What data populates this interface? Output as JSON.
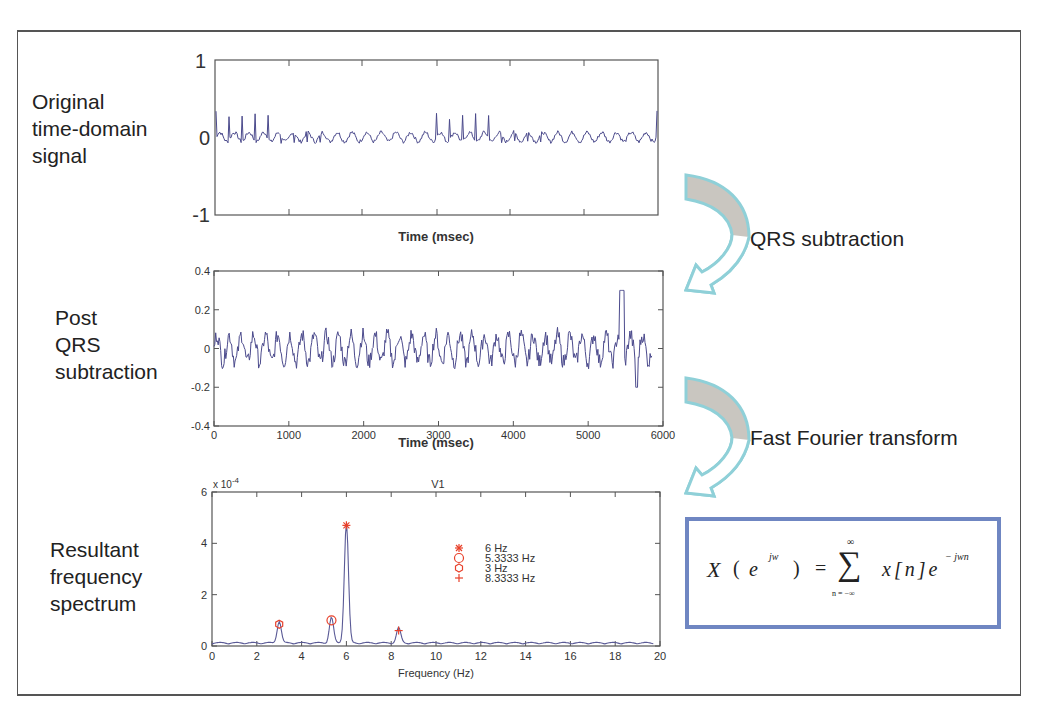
{
  "stages": {
    "original": {
      "label_lines": [
        "Original",
        "time-domain",
        "signal"
      ]
    },
    "post_qrs": {
      "label_lines": [
        "Post",
        "QRS",
        "subtraction"
      ]
    },
    "spectrum": {
      "label_lines": [
        "Resultant",
        "frequency",
        "spectrum"
      ]
    }
  },
  "arrows": {
    "qrs": {
      "label": "QRS subtraction",
      "icon": "curved-arrow-icon"
    },
    "fft": {
      "label": "Fast Fourier transform",
      "icon": "curved-arrow-icon"
    }
  },
  "formula": {
    "lhs": "X",
    "lhs_arg_base": "e",
    "lhs_arg_exp": "jw",
    "equals": "=",
    "sum_symbol": "∑",
    "sum_upper": "∞",
    "sum_lower": "n = −∞",
    "term": "x[n]e",
    "term_exp": "− jwn"
  },
  "colors": {
    "signal": "#4b4a8c",
    "marker": "#e8402a",
    "arrow_outline": "#8fd0d8",
    "arrow_fill": "#c9c6c0",
    "formula_border": "#6f86c2"
  },
  "chart_data": [
    {
      "type": "line",
      "title": "",
      "xlabel": "Time (msec)",
      "ylabel": "",
      "ylim": [
        -1,
        1
      ],
      "yticks": [
        "1",
        "0",
        "-1"
      ],
      "xticks": [],
      "grid": false,
      "description": "Original ECG-like time-domain signal oscillating around 0 with periodic sharp spikes (~0.2-0.35 amplitude)"
    },
    {
      "type": "line",
      "title": "",
      "xlabel": "Time (msec)",
      "ylabel": "",
      "xlim": [
        0,
        6000
      ],
      "ylim": [
        -0.4,
        0.4
      ],
      "xticks": [
        "0",
        "1000",
        "2000",
        "3000",
        "4000",
        "5000",
        "6000"
      ],
      "yticks": [
        "0.4",
        "0.2",
        "0",
        "-0.2",
        "-0.4"
      ],
      "grid": false,
      "description": "Residual signal after QRS subtraction, oscillating between about -0.15 and 0.2 with a spike of ~0.33 near 5450 msec and a dip of ~-0.22 near 5650 msec"
    },
    {
      "type": "line",
      "title": "V1",
      "xlabel": "Frequency (Hz)",
      "ylabel": "",
      "y_multiplier": "x 10^-4",
      "xlim": [
        0,
        20
      ],
      "ylim": [
        0,
        6
      ],
      "xticks": [
        "0",
        "2",
        "4",
        "6",
        "8",
        "10",
        "12",
        "14",
        "16",
        "18",
        "20"
      ],
      "yticks": [
        "6",
        "4",
        "2",
        "0"
      ],
      "grid": false,
      "peaks": [
        {
          "freq": 6,
          "value": 4.7,
          "marker": "asterisk",
          "legend": "6 Hz"
        },
        {
          "freq": 5.3333,
          "value": 1.0,
          "marker": "circle",
          "legend": "5.3333 Hz"
        },
        {
          "freq": 3,
          "value": 0.85,
          "marker": "hexagram",
          "legend": "3 Hz"
        },
        {
          "freq": 8.3333,
          "value": 0.6,
          "marker": "plus",
          "legend": "8.3333 Hz"
        }
      ],
      "legend": [
        "6 Hz",
        "5.3333 Hz",
        "3 Hz",
        "8.3333 Hz"
      ],
      "legend_position": "upper-center"
    }
  ]
}
